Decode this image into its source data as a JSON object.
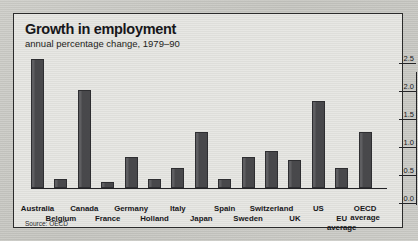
{
  "panel": {
    "title": "Growth in employment",
    "subtitle": "annual percentage change, 1979–90",
    "source": "Source: OECD",
    "colors": {
      "bar_fill": "#4c4c4f",
      "bar_border": "#2e2e31",
      "panel_bg": "#e3e3df",
      "axis": "#232326",
      "text": "#17171a"
    }
  },
  "chart_data": {
    "type": "bar",
    "title": "Growth in employment",
    "subtitle": "annual percentage change, 1979–90",
    "xlabel": "",
    "ylabel": "",
    "ylim": [
      0.0,
      2.5
    ],
    "yticks": [
      "0.0",
      "0.5",
      "1.0",
      "1.5",
      "2.0",
      "2.5"
    ],
    "ytick_values": [
      0.0,
      0.5,
      1.0,
      1.5,
      2.0,
      2.5
    ],
    "grid": false,
    "legend": "none",
    "source": "Source: OECD",
    "categories": [
      "Australia",
      "Belgium",
      "Canada",
      "France",
      "Germany",
      "Holland",
      "Italy",
      "Japan",
      "Spain",
      "Sweden",
      "Switzerland",
      "UK",
      "US",
      "EU average",
      "OECD average"
    ],
    "values": [
      2.3,
      0.15,
      1.75,
      0.1,
      0.55,
      0.15,
      0.35,
      1.0,
      0.15,
      0.55,
      0.65,
      0.5,
      1.55,
      0.35,
      1.0
    ],
    "series": [
      {
        "name": "annual percentage change, 1979-90",
        "values": [
          2.3,
          0.15,
          1.75,
          0.1,
          0.55,
          0.15,
          0.35,
          1.0,
          0.15,
          0.55,
          0.65,
          0.5,
          1.55,
          0.35,
          1.0
        ]
      }
    ],
    "label_rows": [
      0,
      1,
      0,
      1,
      0,
      1,
      0,
      1,
      0,
      1,
      0,
      1,
      0,
      1,
      0
    ],
    "label_text": [
      "Australia",
      "Belgium",
      "Canada",
      "France",
      "Germany",
      "Holland",
      "Italy",
      "Japan",
      "Spain",
      "Sweden",
      "Switzerland",
      "UK",
      "US",
      "EU\naverage",
      "OECD\naverage"
    ]
  }
}
